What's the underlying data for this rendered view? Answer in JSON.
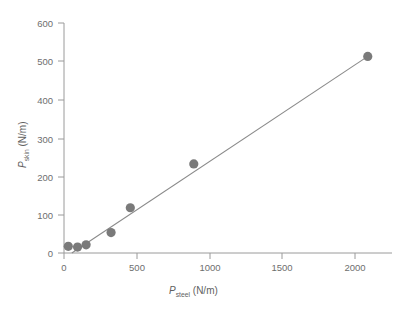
{
  "chart_data": {
    "type": "scatter",
    "title": "",
    "xlabel": "P_steel (N/m)",
    "ylabel": "P_skin (N/m)",
    "xlabel_parts": {
      "symbol": "P",
      "subscript": "steel",
      "units": " (N/m)"
    },
    "ylabel_parts": {
      "symbol": "P",
      "subscript": "skin",
      "units": " (N/m)"
    },
    "xlim": [
      0,
      2300
    ],
    "ylim": [
      0,
      620
    ],
    "xticks": [
      0,
      500,
      1000,
      1500,
      2000
    ],
    "xticklabels": [
      "0",
      "500",
      "1000",
      "1500",
      "2000"
    ],
    "yticks": [
      0,
      100,
      200,
      300,
      400,
      500,
      600
    ],
    "yticklabels": [
      "0",
      "100",
      "200",
      "300",
      "400",
      "500",
      "600"
    ],
    "grid": false,
    "legend": false,
    "marker_color": "#7a7a7a",
    "line_color": "#8a8a8a",
    "axis_color": "#9a9a9a",
    "x": [
      30,
      95,
      155,
      330,
      465,
      910,
      2130
    ],
    "y": [
      18,
      16,
      22,
      55,
      122,
      240,
      530
    ],
    "points": [
      {
        "x": 30,
        "y": 18
      },
      {
        "x": 95,
        "y": 16
      },
      {
        "x": 155,
        "y": 22
      },
      {
        "x": 330,
        "y": 55
      },
      {
        "x": 465,
        "y": 122
      },
      {
        "x": 910,
        "y": 240
      },
      {
        "x": 2130,
        "y": 530
      }
    ],
    "fit_line": {
      "x0": 55,
      "y0": 0,
      "x1": 2130,
      "y1": 530
    }
  }
}
